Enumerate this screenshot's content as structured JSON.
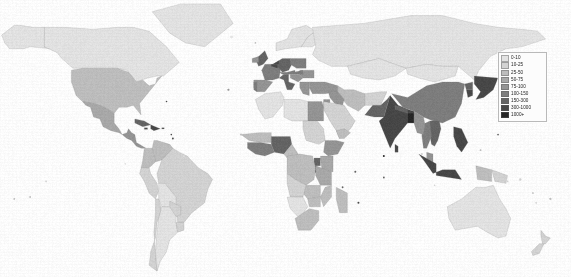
{
  "figure": {
    "type": "choropleth-world-map",
    "background_color": "#fdfdfd",
    "ocean_color": "#ffffff",
    "border_color": "#9a9a9a"
  },
  "chart_data": {
    "type": "heatmap",
    "subtitle": "",
    "xlabel": "",
    "ylabel": "",
    "units": "people per square kilometre",
    "projection": "equirectangular",
    "legend_position": "top-right",
    "grid": false,
    "classes": [
      {
        "label": "0-10",
        "min": 0,
        "max": 10,
        "color": "#e2e2e2"
      },
      {
        "label": "10-25",
        "min": 10,
        "max": 25,
        "color": "#d2d2d2"
      },
      {
        "label": "25-50",
        "min": 25,
        "max": 50,
        "color": "#bdbdbd"
      },
      {
        "label": "50-75",
        "min": 50,
        "max": 75,
        "color": "#a8a8a8"
      },
      {
        "label": "75-100",
        "min": 75,
        "max": 100,
        "color": "#949494"
      },
      {
        "label": "100-150",
        "min": 100,
        "max": 150,
        "color": "#7d7d7d"
      },
      {
        "label": "150-300",
        "min": 150,
        "max": 300,
        "color": "#646464"
      },
      {
        "label": "300-1000",
        "min": 300,
        "max": 1000,
        "color": "#474747"
      },
      {
        "label": "1000+",
        "min": 1000,
        "max": null,
        "color": "#262626"
      }
    ],
    "regions": [
      {
        "name": "Canada",
        "class": "0-10"
      },
      {
        "name": "Alaska",
        "class": "0-10"
      },
      {
        "name": "Greenland",
        "class": "0-10"
      },
      {
        "name": "United States",
        "class": "25-50"
      },
      {
        "name": "Mexico",
        "class": "50-75"
      },
      {
        "name": "Central America",
        "class": "75-100"
      },
      {
        "name": "Caribbean",
        "class": "150-300"
      },
      {
        "name": "Brazil",
        "class": "10-25"
      },
      {
        "name": "Argentina",
        "class": "0-10"
      },
      {
        "name": "Colombia",
        "class": "25-50"
      },
      {
        "name": "Venezuela",
        "class": "25-50"
      },
      {
        "name": "Peru",
        "class": "10-25"
      },
      {
        "name": "Bolivia",
        "class": "0-10"
      },
      {
        "name": "Chile",
        "class": "10-25"
      },
      {
        "name": "United Kingdom",
        "class": "150-300"
      },
      {
        "name": "Germany",
        "class": "150-300"
      },
      {
        "name": "France",
        "class": "100-150"
      },
      {
        "name": "Italy",
        "class": "150-300"
      },
      {
        "name": "Netherlands",
        "class": "300-1000"
      },
      {
        "name": "Belgium",
        "class": "300-1000"
      },
      {
        "name": "Spain",
        "class": "75-100"
      },
      {
        "name": "Poland",
        "class": "100-150"
      },
      {
        "name": "Scandinavia",
        "class": "0-10"
      },
      {
        "name": "Russia",
        "class": "0-10"
      },
      {
        "name": "Kazakhstan",
        "class": "0-10"
      },
      {
        "name": "Turkey",
        "class": "75-100"
      },
      {
        "name": "Egypt",
        "class": "75-100"
      },
      {
        "name": "Saudi Arabia",
        "class": "10-25"
      },
      {
        "name": "Iran",
        "class": "25-50"
      },
      {
        "name": "Pakistan",
        "class": "150-300"
      },
      {
        "name": "India",
        "class": "300-1000"
      },
      {
        "name": "Bangladesh",
        "class": "1000+"
      },
      {
        "name": "Sri Lanka",
        "class": "300-1000"
      },
      {
        "name": "China",
        "class": "100-150"
      },
      {
        "name": "Mongolia",
        "class": "0-10"
      },
      {
        "name": "Japan",
        "class": "300-1000"
      },
      {
        "name": "South Korea",
        "class": "300-1000"
      },
      {
        "name": "Vietnam",
        "class": "150-300"
      },
      {
        "name": "Thailand",
        "class": "100-150"
      },
      {
        "name": "Philippines",
        "class": "300-1000"
      },
      {
        "name": "Indonesia (Java)",
        "class": "300-1000"
      },
      {
        "name": "Malaysia",
        "class": "75-100"
      },
      {
        "name": "Nigeria",
        "class": "150-300"
      },
      {
        "name": "Ethiopia",
        "class": "75-100"
      },
      {
        "name": "Kenya",
        "class": "50-75"
      },
      {
        "name": "Rwanda",
        "class": "300-1000"
      },
      {
        "name": "Burundi",
        "class": "300-1000"
      },
      {
        "name": "Uganda",
        "class": "150-300"
      },
      {
        "name": "Dem. Rep. Congo",
        "class": "25-50"
      },
      {
        "name": "Algeria",
        "class": "0-10"
      },
      {
        "name": "Libya",
        "class": "0-10"
      },
      {
        "name": "Sudan",
        "class": "10-25"
      },
      {
        "name": "South Africa",
        "class": "25-50"
      },
      {
        "name": "Madagascar",
        "class": "25-50"
      },
      {
        "name": "Australia",
        "class": "0-10"
      },
      {
        "name": "New Zealand",
        "class": "10-25"
      },
      {
        "name": "Papua New Guinea",
        "class": "10-25"
      }
    ]
  },
  "legend": {
    "title": "Population density",
    "items": [
      {
        "label": "0-10"
      },
      {
        "label": "10-25"
      },
      {
        "label": "25-50"
      },
      {
        "label": "50-75"
      },
      {
        "label": "75-100"
      },
      {
        "label": "100-150"
      },
      {
        "label": "150-300"
      },
      {
        "label": "300-1000"
      },
      {
        "label": "1000+"
      }
    ]
  }
}
